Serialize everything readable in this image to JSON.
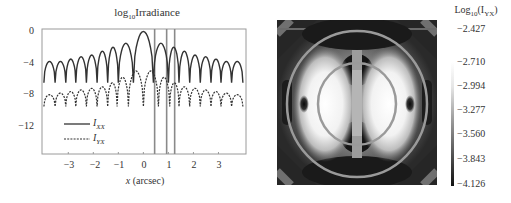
{
  "left_plot": {
    "title_prefix": "log",
    "title_sub": "10",
    "title_suffix": "Irradiance",
    "xlabel": "x (arcsec)",
    "yticks": [
      "0",
      "−4",
      "−8",
      "−12"
    ],
    "xticks": [
      "−3",
      "−2",
      "−1",
      "0",
      "1",
      "2",
      "3"
    ],
    "legend": [
      {
        "name": "I",
        "sub": "XX",
        "style": "solid"
      },
      {
        "name": "I",
        "sub": "YX",
        "style": "dashed"
      }
    ]
  },
  "right_plot": {
    "colorbar_title_prefix": "Log",
    "colorbar_title_sub": "10",
    "colorbar_title_suffix": "(I",
    "colorbar_title_sub2": "YX",
    "colorbar_title_end": ")",
    "colorbar_ticks": [
      "−2.427",
      "−2.710",
      "−2.994",
      "−3.277",
      "−3.560",
      "−3.843",
      "−4.126"
    ]
  },
  "colors": {
    "axis": "#9a9a9a",
    "curve": "#333333",
    "vline": "#8a8a8a",
    "heat_dark": "#141414",
    "heat_light": "#ffffff"
  },
  "chart_data": [
    {
      "type": "line",
      "title": "log10 Irradiance",
      "xlabel": "x (arcsec)",
      "ylabel": "",
      "xlim": [
        -4.05,
        4.1
      ],
      "ylim": [
        -15.5,
        0.3
      ],
      "grid": false,
      "legend_position": "lower left",
      "xticks": [
        -3,
        -2,
        -1,
        0,
        1,
        2,
        3
      ],
      "yticks": [
        0,
        -4,
        -8,
        -12
      ],
      "vertical_lines_x": [
        0.45,
        0.93,
        1.25
      ],
      "series": [
        {
          "name": "I_XX",
          "style": "solid",
          "lobe_centers_x": [
            -3.75,
            -3.3,
            -2.9,
            -2.5,
            -2.05,
            -1.65,
            -1.2,
            -0.8,
            0,
            0.8,
            1.2,
            1.65,
            2.05,
            2.5,
            2.9,
            3.3,
            3.75
          ],
          "lobe_peaks_y": [
            -3.8,
            -3.8,
            -3.5,
            -3.2,
            -3.0,
            -2.5,
            -2.0,
            -1.5,
            0,
            -1.5,
            -2.0,
            -2.5,
            -3.0,
            -3.2,
            -3.5,
            -3.8,
            -3.8
          ],
          "null_y": -6.5
        },
        {
          "name": "I_YX",
          "style": "dashed",
          "lobe_centers_x": [
            -3.75,
            -3.3,
            -2.9,
            -2.5,
            -2.05,
            -1.65,
            -1.2,
            -0.9,
            -0.3,
            0.3,
            0.9,
            1.2,
            1.65,
            2.05,
            2.5,
            2.9,
            3.3,
            3.75
          ],
          "lobe_peaks_y": [
            -8.0,
            -7.8,
            -7.6,
            -7.4,
            -7.2,
            -7.0,
            -6.5,
            -5.8,
            -5.0,
            -5.0,
            -5.8,
            -6.5,
            -7.0,
            -7.2,
            -7.4,
            -7.6,
            -7.8,
            -8.0
          ],
          "null_y": -9.5
        }
      ]
    },
    {
      "type": "heatmap",
      "title": "Log10(I_YX)",
      "colormap": "grayscale",
      "colorbar_ticks": [
        -2.427,
        -2.71,
        -2.994,
        -3.277,
        -3.56,
        -3.843,
        -4.126
      ],
      "color_range": [
        -4.126,
        -2.427
      ]
    }
  ]
}
